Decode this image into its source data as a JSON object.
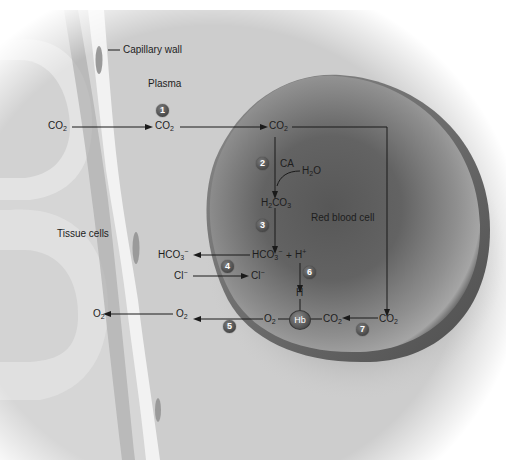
{
  "diagram": {
    "type": "physiology-diagram",
    "regions": {
      "capillary_wall": "Capillary wall",
      "plasma": "Plasma",
      "tissue_cells": "Tissue cells",
      "red_blood_cell": "Red blood cell"
    },
    "molecules": {
      "co2_tissue": {
        "base": "CO",
        "sub": "2"
      },
      "co2_plasma": {
        "base": "CO",
        "sub": "2"
      },
      "co2_rbc_top": {
        "base": "CO",
        "sub": "2"
      },
      "ca": "CA",
      "h2o": {
        "pre": "H",
        "sub": "2",
        "post": "O"
      },
      "h2co3": {
        "pre": "H",
        "sub1": "2",
        "mid": "CO",
        "sub2": "3"
      },
      "hco3_rbc": {
        "base": "HCO",
        "sub": "3",
        "sup": "−"
      },
      "plus": "+",
      "h_plus": {
        "base": "H",
        "sup": "+"
      },
      "hco3_plasma": {
        "base": "HCO",
        "sub": "3",
        "sup": "−"
      },
      "cl_plasma": {
        "base": "Cl",
        "sup": "−"
      },
      "cl_rbc": {
        "base": "Cl",
        "sup": "−"
      },
      "h_bound": "H",
      "hb": "Hb",
      "o2_rbc": {
        "base": "O",
        "sub": "2"
      },
      "o2_plasma": {
        "base": "O",
        "sub": "2"
      },
      "o2_tissue": {
        "base": "O",
        "sub": "2"
      },
      "co2_hb": {
        "base": "CO",
        "sub": "2"
      },
      "co2_rbc_right": {
        "base": "CO",
        "sub": "2"
      }
    },
    "steps": [
      "1",
      "2",
      "3",
      "4",
      "5",
      "6",
      "7"
    ],
    "colors": {
      "background": "#ffffff",
      "tissue_light": "#e2e2e2",
      "tissue_shadow": "#bdbdbd",
      "capillary_wall": "#f1f1f1",
      "plasma": "#c9c9c9",
      "rbc_center": "#5e5e5e",
      "rbc_rim": "#9a9a9a",
      "step_badge": "#555555",
      "arrow": "#1a1a1a"
    }
  }
}
